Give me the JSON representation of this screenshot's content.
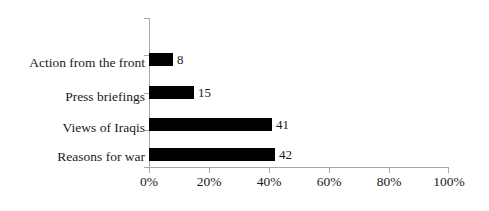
{
  "chart_data": {
    "type": "bar",
    "orientation": "horizontal",
    "title": "",
    "subtitle": "",
    "xlabel": "",
    "ylabel": "",
    "categories": [
      "Action from the front",
      "Press briefings",
      "Views of Iraqis",
      "Reasons for war"
    ],
    "values": [
      8,
      15,
      41,
      42
    ],
    "data_labels": [
      "8",
      "15",
      "41",
      "42"
    ],
    "xlim": [
      0,
      100
    ],
    "xticks": [
      0,
      20,
      40,
      60,
      80,
      100
    ],
    "xtick_labels": [
      "0%",
      "20%",
      "40%",
      "60%",
      "80%",
      "100%"
    ],
    "grid": false,
    "legend": null,
    "bar_color": "#000000",
    "axis_color": "#a8a8a8",
    "text_color": "#1a1a1a",
    "background": "#ffffff"
  }
}
